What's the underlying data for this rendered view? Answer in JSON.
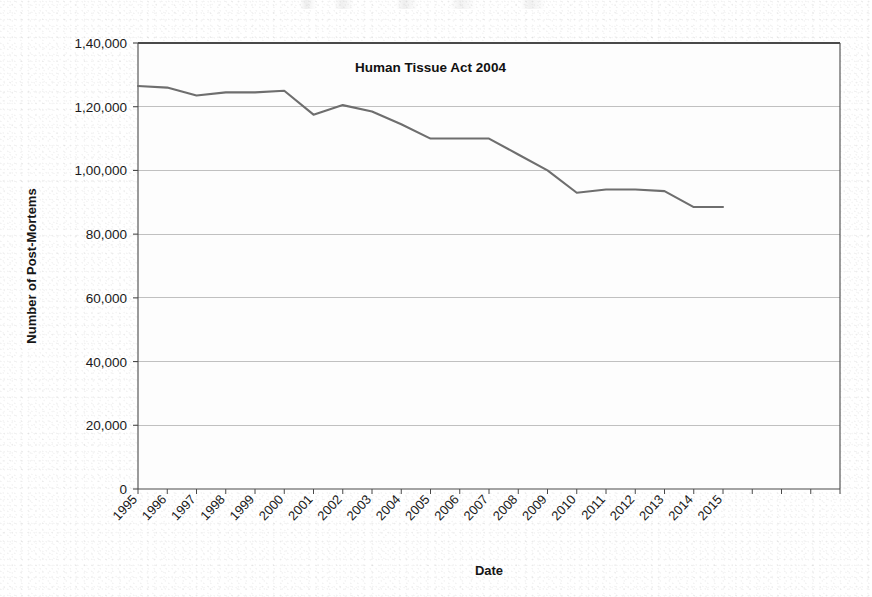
{
  "chart_data": {
    "type": "line",
    "title": "",
    "xlabel": "Date",
    "ylabel": "Number of Post-Mortems",
    "grid": true,
    "legend": "none",
    "xlim": [
      1995,
      2019
    ],
    "ylim": [
      0,
      140000
    ],
    "yticks": [
      0,
      20000,
      40000,
      60000,
      80000,
      100000,
      120000,
      140000
    ],
    "ytick_labels": [
      "0",
      "20,000",
      "40,000",
      "60,000",
      "80,000",
      "1,00,000",
      "1,20,000",
      "1,40,000"
    ],
    "x": [
      1995,
      1996,
      1997,
      1998,
      1999,
      2000,
      2001,
      2002,
      2003,
      2004,
      2005,
      2006,
      2007,
      2008,
      2009,
      2010,
      2011,
      2012,
      2013,
      2014,
      2015
    ],
    "categories": [
      "1995",
      "1996",
      "1997",
      "1998",
      "1999",
      "2000",
      "2001",
      "2002",
      "2003",
      "2004",
      "2005",
      "2006",
      "2007",
      "2008",
      "2009",
      "2010",
      "2011",
      "2012",
      "2013",
      "2014",
      "2015"
    ],
    "values": [
      126500,
      126000,
      123500,
      124500,
      124500,
      125000,
      117500,
      120500,
      118500,
      114500,
      110000,
      110000,
      110000,
      105000,
      100000,
      93000,
      94000,
      94000,
      93500,
      88500,
      88500
    ],
    "series": [
      {
        "name": "Number of Post-Mortems",
        "color": "#6e6e6e",
        "values": [
          126500,
          126000,
          123500,
          124500,
          124500,
          125000,
          117500,
          120500,
          118500,
          114500,
          110000,
          110000,
          110000,
          105000,
          100000,
          93000,
          94000,
          94000,
          93500,
          88500,
          88500
        ]
      }
    ],
    "annotations": [
      {
        "text": "Human Tissue Act 2004",
        "x": 2005,
        "y": 131000
      }
    ]
  },
  "axes": {
    "y_title": "Number of Post-Mortems",
    "x_title": "Date"
  },
  "annotation": {
    "human_tissue_act": "Human Tissue Act 2004"
  },
  "colors": {
    "line": "#6e6e6e",
    "axis": "#4a4a4a",
    "grid": "#b9b9b9",
    "text": "#1a1a1a",
    "plot_background": "#fdfdfd"
  }
}
